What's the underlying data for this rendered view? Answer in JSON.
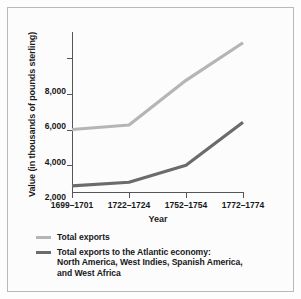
{
  "chart_data": {
    "type": "line",
    "title": "",
    "xlabel": "Year",
    "ylabel": "Value (in thousands of pounds sterling)",
    "categories": [
      "1699–1701",
      "1722–1724",
      "1752–1754",
      "1772–1774"
    ],
    "series": [
      {
        "name": "Total exports",
        "color": "#b5b5b5",
        "values": [
          3550,
          3800,
          6300,
          8400
        ]
      },
      {
        "name": "Total exports to the Atlantic economy: North America, West Indies, Spanish America, and West Africa",
        "color": "#6b6b6b",
        "values": [
          400,
          600,
          1550,
          3950
        ]
      }
    ],
    "ylim": [
      0,
      9000
    ],
    "yticks": [
      2000,
      4000,
      6000,
      8000
    ],
    "ytick_labels": [
      "2,000",
      "4,000",
      "6,000",
      "8,000"
    ],
    "grid": false,
    "legend_position": "below"
  },
  "legend": {
    "items": [
      {
        "color": "#b5b5b5",
        "lines": [
          "Total exports"
        ]
      },
      {
        "color": "#6b6b6b",
        "lines": [
          "Total exports to the Atlantic economy:",
          "North America, West Indies, Spanish America,",
          "and West Africa"
        ]
      }
    ]
  }
}
